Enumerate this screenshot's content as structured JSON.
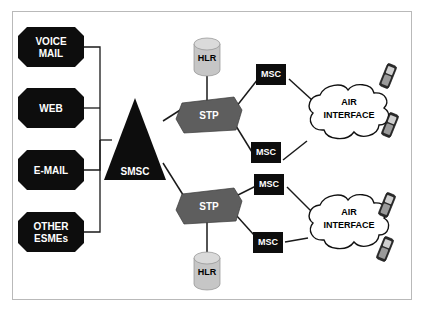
{
  "diagram": {
    "type": "network-topology",
    "background_color": "#ffffff",
    "frame_color": "#b9b9b9",
    "colors": {
      "esme_fill": "#0d0d0d",
      "esme_text": "#ffffff",
      "smsc_fill": "#0d0d0d",
      "smsc_text": "#ffffff",
      "stp_fill": "#5e5e5e",
      "stp_text": "#ffffff",
      "msc_fill": "#0d0d0d",
      "msc_text": "#ffffff",
      "hlr_fill": "#c6c6c6",
      "hlr_text": "#000000",
      "cloud_fill": "#ffffff",
      "cloud_text": "#000000",
      "link_color": "#1a1a1a"
    },
    "esmes": [
      {
        "id": "voice-mail",
        "line1": "VOICE",
        "line2": "MAIL"
      },
      {
        "id": "web",
        "line1": "WEB",
        "line2": ""
      },
      {
        "id": "e-mail",
        "line1": "E-MAIL",
        "line2": ""
      },
      {
        "id": "other-esmes",
        "line1": "OTHER",
        "line2": "ESMEs"
      }
    ],
    "smsc": {
      "label": "SMSC"
    },
    "stps": [
      {
        "id": "stp-upper",
        "label": "STP"
      },
      {
        "id": "stp-lower",
        "label": "STP"
      }
    ],
    "hlrs": [
      {
        "id": "hlr-upper",
        "label": "HLR"
      },
      {
        "id": "hlr-lower",
        "label": "HLR"
      }
    ],
    "mscs": [
      {
        "id": "msc-upper-1",
        "label": "MSC"
      },
      {
        "id": "msc-upper-2",
        "label": "MSC"
      },
      {
        "id": "msc-lower-1",
        "label": "MSC"
      },
      {
        "id": "msc-lower-2",
        "label": "MSC"
      }
    ],
    "clouds": [
      {
        "id": "air-interface-upper",
        "line1": "AIR",
        "line2": "INTERFACE"
      },
      {
        "id": "air-interface-lower",
        "line1": "AIR",
        "line2": "INTERFACE"
      }
    ],
    "handsets": [
      {
        "id": "handset-upper-1"
      },
      {
        "id": "handset-upper-2"
      },
      {
        "id": "handset-lower-1"
      },
      {
        "id": "handset-lower-2"
      }
    ]
  }
}
